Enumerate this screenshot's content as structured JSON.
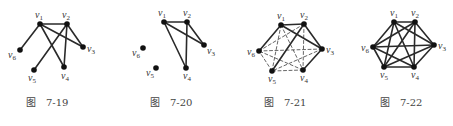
{
  "figures": [
    {
      "id": "fig-7-19",
      "caption_prefix": "图",
      "caption_number": "7-19",
      "caption_pos": [
        26,
        106
      ],
      "vertices": [
        {
          "name": "v1",
          "x": 40,
          "y": 24,
          "label_dx": -5,
          "label_dy": -6
        },
        {
          "name": "v2",
          "x": 67,
          "y": 24,
          "label_dx": -5,
          "label_dy": -6
        },
        {
          "name": "v3",
          "x": 83,
          "y": 47,
          "label_dx": 4,
          "label_dy": 5
        },
        {
          "name": "v4",
          "x": 64,
          "y": 67,
          "label_dx": -3,
          "label_dy": 12
        },
        {
          "name": "v5",
          "x": 34,
          "y": 70,
          "label_dx": -6,
          "label_dy": 11
        },
        {
          "name": "v6",
          "x": 20,
          "y": 50,
          "label_dx": -12,
          "label_dy": 8
        }
      ],
      "edges": [
        {
          "from": "v1",
          "to": "v2",
          "style": "solid"
        },
        {
          "from": "v1",
          "to": "v6",
          "style": "solid"
        },
        {
          "from": "v1",
          "to": "v3",
          "style": "solid"
        },
        {
          "from": "v1",
          "to": "v4",
          "style": "solid"
        },
        {
          "from": "v2",
          "to": "v3",
          "style": "solid"
        },
        {
          "from": "v2",
          "to": "v4",
          "style": "solid"
        },
        {
          "from": "v2",
          "to": "v5",
          "style": "solid"
        }
      ]
    },
    {
      "id": "fig-7-20",
      "caption_prefix": "图",
      "caption_number": "7-20",
      "caption_pos": [
        150,
        106
      ],
      "vertices": [
        {
          "name": "v1",
          "x": 164,
          "y": 22,
          "label_dx": -6,
          "label_dy": -6
        },
        {
          "name": "v2",
          "x": 187,
          "y": 22,
          "label_dx": -4,
          "label_dy": -6
        },
        {
          "name": "v3",
          "x": 204,
          "y": 45,
          "label_dx": 3,
          "label_dy": 9
        },
        {
          "name": "v4",
          "x": 186,
          "y": 68,
          "label_dx": -3,
          "label_dy": 11
        },
        {
          "name": "v5",
          "x": 156,
          "y": 68,
          "label_dx": -10,
          "label_dy": 8
        },
        {
          "name": "v6",
          "x": 143,
          "y": 48,
          "label_dx": -11,
          "label_dy": 8
        }
      ],
      "edges": [
        {
          "from": "v1",
          "to": "v2",
          "style": "solid"
        },
        {
          "from": "v1",
          "to": "v3",
          "style": "solid"
        },
        {
          "from": "v1",
          "to": "v4",
          "style": "solid"
        },
        {
          "from": "v2",
          "to": "v3",
          "style": "solid"
        },
        {
          "from": "v2",
          "to": "v4",
          "style": "solid"
        }
      ]
    },
    {
      "id": "fig-7-21",
      "caption_prefix": "图",
      "caption_number": "7-21",
      "caption_pos": [
        264,
        106
      ],
      "vertices": [
        {
          "name": "v1",
          "x": 281,
          "y": 25,
          "label_dx": -4,
          "label_dy": -6
        },
        {
          "name": "v2",
          "x": 304,
          "y": 24,
          "label_dx": -4,
          "label_dy": -6
        },
        {
          "name": "v3",
          "x": 322,
          "y": 49,
          "label_dx": 4,
          "label_dy": 4
        },
        {
          "name": "v4",
          "x": 303,
          "y": 70,
          "label_dx": -3,
          "label_dy": 11
        },
        {
          "name": "v5",
          "x": 272,
          "y": 71,
          "label_dx": -4,
          "label_dy": 11
        },
        {
          "name": "v6",
          "x": 259,
          "y": 51,
          "label_dx": -12,
          "label_dy": 4
        }
      ],
      "edges": [
        {
          "from": "v1",
          "to": "v2",
          "style": "solid"
        },
        {
          "from": "v1",
          "to": "v6",
          "style": "solid"
        },
        {
          "from": "v1",
          "to": "v3",
          "style": "solid"
        },
        {
          "from": "v2",
          "to": "v3",
          "style": "solid"
        },
        {
          "from": "v2",
          "to": "v5",
          "style": "solid"
        },
        {
          "from": "v3",
          "to": "v4",
          "style": "solid"
        },
        {
          "from": "v1",
          "to": "v4",
          "style": "dashed"
        },
        {
          "from": "v1",
          "to": "v5",
          "style": "dashed"
        },
        {
          "from": "v2",
          "to": "v4",
          "style": "dashed"
        },
        {
          "from": "v2",
          "to": "v6",
          "style": "dashed"
        },
        {
          "from": "v3",
          "to": "v5",
          "style": "dashed"
        },
        {
          "from": "v3",
          "to": "v6",
          "style": "dashed"
        },
        {
          "from": "v4",
          "to": "v5",
          "style": "dashed"
        },
        {
          "from": "v4",
          "to": "v6",
          "style": "dashed"
        },
        {
          "from": "v5",
          "to": "v6",
          "style": "dashed"
        }
      ]
    },
    {
      "id": "fig-7-22",
      "caption_prefix": "图",
      "caption_number": "7-22",
      "caption_pos": [
        380,
        106
      ],
      "vertices": [
        {
          "name": "v1",
          "x": 394,
          "y": 22,
          "label_dx": -4,
          "label_dy": -6
        },
        {
          "name": "v2",
          "x": 415,
          "y": 22,
          "label_dx": -4,
          "label_dy": -6
        },
        {
          "name": "v3",
          "x": 434,
          "y": 45,
          "label_dx": 4,
          "label_dy": 4
        },
        {
          "name": "v4",
          "x": 414,
          "y": 67,
          "label_dx": -3,
          "label_dy": 11
        },
        {
          "name": "v5",
          "x": 384,
          "y": 67,
          "label_dx": -4,
          "label_dy": 11
        },
        {
          "name": "v6",
          "x": 373,
          "y": 47,
          "label_dx": -12,
          "label_dy": 4
        }
      ],
      "edges": [
        {
          "from": "v1",
          "to": "v2",
          "style": "solid"
        },
        {
          "from": "v1",
          "to": "v3",
          "style": "solid"
        },
        {
          "from": "v1",
          "to": "v4",
          "style": "solid"
        },
        {
          "from": "v1",
          "to": "v5",
          "style": "solid"
        },
        {
          "from": "v1",
          "to": "v6",
          "style": "solid"
        },
        {
          "from": "v2",
          "to": "v3",
          "style": "solid"
        },
        {
          "from": "v2",
          "to": "v4",
          "style": "solid"
        },
        {
          "from": "v2",
          "to": "v5",
          "style": "solid"
        },
        {
          "from": "v2",
          "to": "v6",
          "style": "solid"
        },
        {
          "from": "v3",
          "to": "v4",
          "style": "solid"
        },
        {
          "from": "v3",
          "to": "v5",
          "style": "solid"
        },
        {
          "from": "v3",
          "to": "v6",
          "style": "solid"
        },
        {
          "from": "v4",
          "to": "v5",
          "style": "solid"
        },
        {
          "from": "v4",
          "to": "v6",
          "style": "solid"
        },
        {
          "from": "v5",
          "to": "v6",
          "style": "solid"
        }
      ]
    }
  ]
}
